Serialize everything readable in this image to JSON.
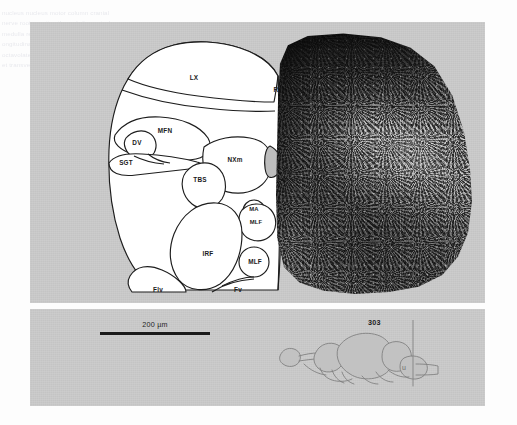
{
  "figure": {
    "type": "histological-section-figure",
    "caption_bleed_text": "nucleus nucleus motor column cranial nerve roots section through the rostral medulla reticular formation fasciculus longitudinalis medialis vestibular nuclei octavolateralis area stained cresyl violet transverse plane",
    "panels": [
      {
        "name": "main",
        "description": "Transverse half-section: line drawing (left) mirrored against photomicrograph (right)"
      },
      {
        "name": "legend",
        "description": "Scale bar and lateral brain schematic with section level marker"
      }
    ],
    "background_color": "#c9c9c9",
    "page_color": "#fdfdfd"
  },
  "schematic": {
    "title": "half-section-line-drawing",
    "labels": [
      {
        "id": "lx",
        "text": "LX",
        "x": 112,
        "y": 46,
        "size": "normal"
      },
      {
        "id": "rv",
        "text": "RV",
        "x": 196,
        "y": 58,
        "size": "normal"
      },
      {
        "id": "mfn",
        "text": "MFN",
        "x": 83,
        "y": 99,
        "size": "normal"
      },
      {
        "id": "dv",
        "text": "DV",
        "x": 55,
        "y": 111,
        "size": "normal"
      },
      {
        "id": "sgt",
        "text": "SGT",
        "x": 44,
        "y": 131,
        "size": "normal"
      },
      {
        "id": "nxm",
        "text": "NXm",
        "x": 153,
        "y": 128,
        "size": "normal"
      },
      {
        "id": "tbs",
        "text": "TBS",
        "x": 118,
        "y": 148,
        "size": "normal"
      },
      {
        "id": "ma",
        "text": "MA",
        "x": 172,
        "y": 176,
        "size": "small"
      },
      {
        "id": "mlf1",
        "text": "MLF",
        "x": 174,
        "y": 189,
        "size": "small"
      },
      {
        "id": "irf",
        "text": "IRF",
        "x": 126,
        "y": 222,
        "size": "normal"
      },
      {
        "id": "mlf2",
        "text": "MLF",
        "x": 173,
        "y": 228,
        "size": "normal"
      },
      {
        "id": "flv",
        "text": "Flv",
        "x": 76,
        "y": 258,
        "size": "normal"
      },
      {
        "id": "fv",
        "text": "Fv",
        "x": 156,
        "y": 258,
        "size": "normal"
      }
    ],
    "abbreviations": {
      "LX": "lobus vagi",
      "RV": "rhombencephalic ventricle",
      "MFN": "medial funicular nucleus",
      "DV": "descending trigeminal nucleus",
      "SGT": "secondary gustatory tract",
      "NXm": "motor nucleus of nerve X",
      "TBS": "tractus bulbospinalis",
      "MA": "Mauthner axon",
      "MLF": "medial longitudinal fasciculus",
      "IRF": "inferior reticular formation",
      "Flv": "funiculus lateralis ventralis",
      "Fv": "funiculus ventralis"
    }
  },
  "micrograph": {
    "name": "photomicrograph-half-section",
    "description": "Nissl-stained transverse half-section of the medulla, mirror image of the line drawing"
  },
  "legend": {
    "scale_bar": {
      "label": "200 µm",
      "length_px": 110
    },
    "section_marker": {
      "number": "303",
      "label_for": "section level on lateral brain outline"
    },
    "lateral_diagram": {
      "name": "lateral-brain-outline",
      "sub_label": "u"
    }
  }
}
